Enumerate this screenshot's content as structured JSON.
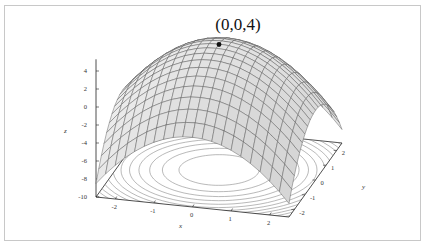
{
  "chart_data": {
    "type": "surface3d",
    "title": "(0,0,4)",
    "function": "z = 4 - x^2 - y^2",
    "surface_style": "wireframe mesh with light gray shading",
    "contours_on_base": true,
    "highlight_point": {
      "x": 0,
      "y": 0,
      "z": 4,
      "label": "(0,0,4)"
    },
    "x_range": [
      -2.5,
      2.5
    ],
    "y_range": [
      -2.5,
      2.5
    ],
    "z_range": [
      -10,
      5
    ],
    "grid_steps": 20,
    "contour_levels": [
      3,
      2,
      1,
      0,
      -1,
      -2,
      -3,
      -4,
      -5,
      -6,
      -7,
      -8
    ],
    "axes": {
      "x": {
        "label": "x",
        "ticks": [
          "-2",
          "-1",
          "0",
          "1",
          "2"
        ],
        "values": [
          -2,
          -1,
          0,
          1,
          2
        ]
      },
      "y": {
        "label": "y",
        "ticks": [
          "-2",
          "-1",
          "0",
          "1",
          "2"
        ],
        "values": [
          -2,
          -1,
          0,
          1,
          2
        ]
      },
      "z": {
        "label": "z",
        "ticks": [
          "4",
          "2",
          "0",
          "-2",
          "-4",
          "-6",
          "-8",
          "-10"
        ],
        "values": [
          4,
          2,
          0,
          -2,
          -4,
          -6,
          -8,
          -10
        ]
      }
    },
    "projection": {
      "origin": [
        219,
        80
      ],
      "ex": [
        38.6,
        4.0
      ],
      "ey": [
        10.6,
        -14.8
      ],
      "ez": [
        0,
        -9.0
      ]
    },
    "colors": {
      "surface_fill": "#e6e6e6",
      "surface_fill_dark": "#cfcfcf",
      "mesh_line": "#555555",
      "contour": "#8a8a8a",
      "axis": "#222222",
      "point": "#111111"
    }
  }
}
